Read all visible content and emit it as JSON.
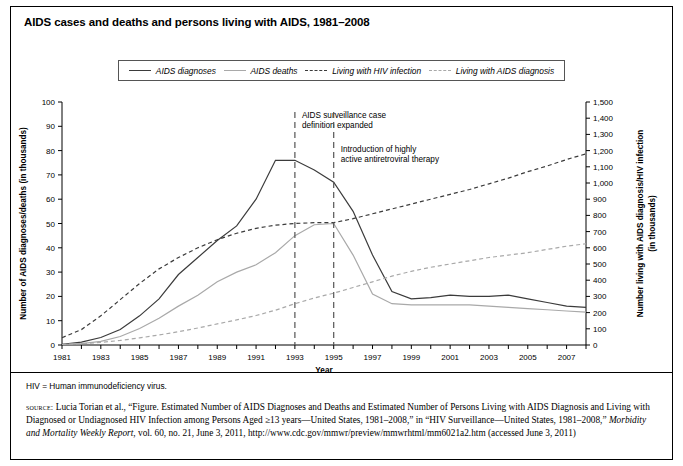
{
  "title": "AIDS cases and deaths and persons living with AIDS, 1981–2008",
  "legend": {
    "position": "top-center",
    "items": [
      {
        "label": "AIDS diagnoses",
        "style": "solid",
        "color": "#3b3b3b"
      },
      {
        "label": "AIDS deaths",
        "style": "solid",
        "color": "#a9a9a9"
      },
      {
        "label": "Living with HIV infection",
        "style": "dashed",
        "color": "#3b3b3b"
      },
      {
        "label": "Living with AIDS diagnosis",
        "style": "dashed",
        "color": "#a9a9a9"
      }
    ]
  },
  "annotations": [
    {
      "id": "ann-1993",
      "year": 1993,
      "line1": "AIDS surveillance case",
      "line2": "definition expanded"
    },
    {
      "id": "ann-1995",
      "year": 1995,
      "line1": "Introduction of highly",
      "line2": "active antiretroviral therapy"
    }
  ],
  "footnote": "HIV = Human immunodeficiency virus.",
  "source": {
    "label": "source:",
    "text": " Lucia Torian et al., “Figure. Estimated Number of AIDS Diagnoses and Deaths and Estimated Number of Persons Living with AIDS Diagnosis and Living with Diagnosed or Undiagnosed HIV Infection among Persons Aged ≥13 years—United States, 1981–2008,” in “HIV Surveillance—United States, 1981–2008,” ",
    "italic": "Morbidity and Mortality Weekly Report",
    "text2": ", vol. 60, no. 21, June 3, 2011, http://www.cdc.gov/mmwr/preview/mmwrhtml/mm6021a2.htm (accessed June 3, 2011)"
  },
  "chart_data": {
    "type": "line",
    "title": "AIDS cases and deaths and persons living with AIDS, 1981–2008",
    "xlabel": "Year",
    "ylabel": "Number of AIDS diagnoses/deaths (in thousands)",
    "y2label": "Number living with AIDS diagnosis/HIV infection (in thousands)",
    "xlim": [
      1981,
      2008
    ],
    "ylim": [
      0,
      100
    ],
    "y2lim": [
      0,
      1500
    ],
    "grid": false,
    "x": [
      1981,
      1982,
      1983,
      1984,
      1985,
      1986,
      1987,
      1988,
      1989,
      1990,
      1991,
      1992,
      1993,
      1994,
      1995,
      1996,
      1997,
      1998,
      1999,
      2000,
      2001,
      2002,
      2003,
      2004,
      2005,
      2006,
      2007,
      2008
    ],
    "xticks": [
      1981,
      1983,
      1985,
      1987,
      1989,
      1991,
      1993,
      1995,
      1997,
      1999,
      2001,
      2003,
      2005,
      2007
    ],
    "yticks": [
      0,
      10,
      20,
      30,
      40,
      50,
      60,
      70,
      80,
      90,
      100
    ],
    "y2ticks": [
      0,
      100,
      200,
      300,
      400,
      500,
      600,
      700,
      800,
      900,
      1000,
      1100,
      1200,
      1300,
      1400,
      1500
    ],
    "series": [
      {
        "name": "AIDS diagnoses",
        "axis": "left",
        "style": "solid",
        "color": "#3b3b3b",
        "values": [
          0.3,
          1.2,
          3.1,
          6.4,
          12.0,
          19.0,
          29.0,
          36.0,
          43.0,
          49.0,
          60.0,
          76.0,
          76.0,
          72.0,
          67.0,
          55.0,
          37.0,
          22.0,
          19.0,
          19.5,
          20.5,
          20.0,
          20.0,
          20.5,
          19.0,
          17.5,
          16.0,
          15.5
        ]
      },
      {
        "name": "AIDS deaths",
        "axis": "left",
        "style": "solid",
        "color": "#a9a9a9",
        "values": [
          0.2,
          0.6,
          1.5,
          3.5,
          6.8,
          11.0,
          16.0,
          20.5,
          26.0,
          30.0,
          33.0,
          38.0,
          45.0,
          49.5,
          50.0,
          37.0,
          21.0,
          17.0,
          16.5,
          16.5,
          16.5,
          16.5,
          16.0,
          15.5,
          15.0,
          14.5,
          14.0,
          13.5
        ]
      },
      {
        "name": "Living with HIV infection",
        "axis": "right",
        "style": "dashed",
        "color": "#3b3b3b",
        "values": [
          45,
          95,
          180,
          280,
          380,
          470,
          540,
          600,
          650,
          690,
          720,
          740,
          750,
          755,
          755,
          780,
          810,
          840,
          870,
          900,
          930,
          960,
          995,
          1030,
          1070,
          1105,
          1145,
          1180
        ]
      },
      {
        "name": "Living with AIDS diagnosis",
        "axis": "right",
        "style": "dashed",
        "color": "#a9a9a9",
        "values": [
          3,
          8,
          16,
          28,
          44,
          62,
          82,
          105,
          130,
          155,
          182,
          215,
          255,
          290,
          320,
          355,
          390,
          425,
          455,
          480,
          500,
          520,
          540,
          555,
          570,
          590,
          610,
          625
        ]
      }
    ]
  }
}
